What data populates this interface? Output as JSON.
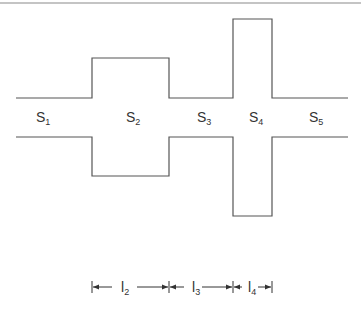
{
  "diagram": {
    "sections": [
      {
        "id": "S1",
        "label": "S",
        "subscript": "1"
      },
      {
        "id": "S2",
        "label": "S",
        "subscript": "2"
      },
      {
        "id": "S3",
        "label": "S",
        "subscript": "3"
      },
      {
        "id": "S4",
        "label": "S",
        "subscript": "4"
      },
      {
        "id": "S5",
        "label": "S",
        "subscript": "5"
      }
    ],
    "dimensions": [
      {
        "id": "l2",
        "label": "l",
        "subscript": "2"
      },
      {
        "id": "l3",
        "label": "l",
        "subscript": "3"
      },
      {
        "id": "l4",
        "label": "l",
        "subscript": "4"
      }
    ],
    "colors": {
      "line": "#555555",
      "text": "#333333",
      "border": "#b0b0b0"
    }
  }
}
